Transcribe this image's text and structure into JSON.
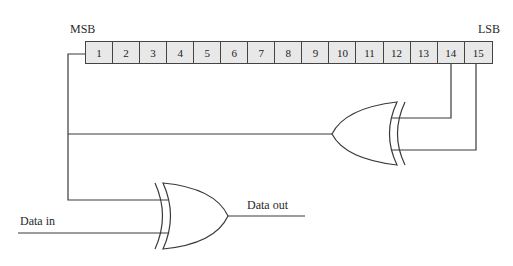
{
  "diagram": {
    "title_partial": "",
    "labels": {
      "msb": "MSB",
      "lsb": "LSB",
      "data_in": "Data in",
      "data_out": "Data out"
    },
    "register": {
      "cells": [
        "1",
        "2",
        "3",
        "4",
        "5",
        "6",
        "7",
        "8",
        "9",
        "10",
        "11",
        "12",
        "13",
        "14",
        "15"
      ],
      "fill_color": "#e8e8e8",
      "taps": [
        "14",
        "15"
      ]
    },
    "gates": [
      {
        "type": "XOR",
        "role": "feedback-gate",
        "inputs": [
          "14",
          "15"
        ],
        "output_to": "MSB (cell 1)"
      },
      {
        "type": "XOR",
        "role": "data-scrambler",
        "inputs": [
          "feedback",
          "Data in"
        ],
        "output": "Data out"
      }
    ],
    "line_color": "#3a3a3a"
  }
}
